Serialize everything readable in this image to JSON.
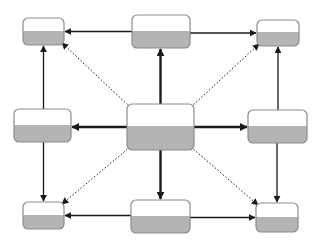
{
  "diagram": {
    "title": "",
    "colors": {
      "background": "#ffffff",
      "node_top": "#ffffff",
      "node_bottom": "#b4b4b4",
      "node_border": "#8c8c8c",
      "edge": "#1a1a1a"
    },
    "nodes": [
      {
        "id": "top-left",
        "label": ""
      },
      {
        "id": "top-center",
        "label": ""
      },
      {
        "id": "top-right",
        "label": ""
      },
      {
        "id": "middle-left",
        "label": ""
      },
      {
        "id": "center",
        "label": ""
      },
      {
        "id": "middle-right",
        "label": ""
      },
      {
        "id": "bottom-left",
        "label": ""
      },
      {
        "id": "bottom-center",
        "label": ""
      },
      {
        "id": "bottom-right",
        "label": ""
      }
    ],
    "edges": [
      {
        "from": "center",
        "to": "top-center",
        "style": "solid-thick"
      },
      {
        "from": "center",
        "to": "middle-left",
        "style": "solid-thick"
      },
      {
        "from": "center",
        "to": "middle-right",
        "style": "solid-thick"
      },
      {
        "from": "center",
        "to": "bottom-center",
        "style": "solid-thick"
      },
      {
        "from": "center",
        "to": "top-left",
        "style": "dotted"
      },
      {
        "from": "center",
        "to": "top-right",
        "style": "dotted"
      },
      {
        "from": "center",
        "to": "bottom-left",
        "style": "dotted"
      },
      {
        "from": "center",
        "to": "bottom-right",
        "style": "dotted"
      },
      {
        "from": "top-center",
        "to": "top-left",
        "style": "solid"
      },
      {
        "from": "top-center",
        "to": "top-right",
        "style": "solid"
      },
      {
        "from": "middle-left",
        "to": "top-left",
        "style": "solid"
      },
      {
        "from": "middle-left",
        "to": "bottom-left",
        "style": "solid"
      },
      {
        "from": "middle-right",
        "to": "top-right",
        "style": "solid"
      },
      {
        "from": "middle-right",
        "to": "bottom-right",
        "style": "solid"
      },
      {
        "from": "bottom-center",
        "to": "bottom-left",
        "style": "solid"
      },
      {
        "from": "bottom-center",
        "to": "bottom-right",
        "style": "solid"
      }
    ]
  }
}
